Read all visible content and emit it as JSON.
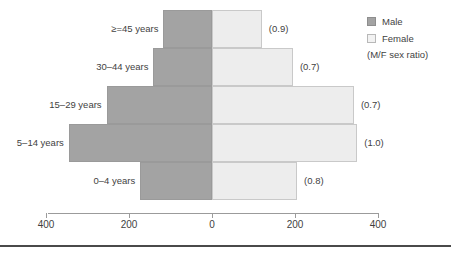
{
  "chart_data": {
    "type": "bar",
    "subtype": "population-pyramid",
    "title": "",
    "xlabel": "",
    "ylabel": "",
    "xlim": [
      -400,
      400
    ],
    "xticks": [
      -400,
      -200,
      0,
      200,
      400
    ],
    "xtick_labels": [
      "400",
      "200",
      "0",
      "200",
      "400"
    ],
    "grid": false,
    "legend_position": "top-right",
    "categories": [
      "0–4 years",
      "5–14 years",
      "15–29 years",
      "30–44 years",
      "≥=45 years"
    ],
    "series": [
      {
        "name": "Male",
        "color": "#a3a3a3",
        "values": [
          173,
          345,
          254,
          141,
          117
        ]
      },
      {
        "name": "Female",
        "color": "#ededed",
        "values": [
          205,
          350,
          342,
          195,
          120
        ]
      }
    ],
    "annotations": {
      "label": "(M/F sex ratio)",
      "values": [
        "(0.8)",
        "(1.0)",
        "(0.7)",
        "(0.7)",
        "(0.9)"
      ]
    },
    "rows": [
      {
        "age": "≥=45 years",
        "male": 117,
        "female": 120,
        "ratio": "(0.9)"
      },
      {
        "age": "30–44 years",
        "male": 141,
        "female": 195,
        "ratio": "(0.7)"
      },
      {
        "age": "15–29 years",
        "male": 254,
        "female": 342,
        "ratio": "(0.7)"
      },
      {
        "age": "5–14 years",
        "male": 345,
        "female": 350,
        "ratio": "(1.0)"
      },
      {
        "age": "0–4 years",
        "male": 173,
        "female": 205,
        "ratio": "(0.8)"
      }
    ]
  },
  "axis": {
    "ticks": [
      {
        "label": "400",
        "value": -400
      },
      {
        "label": "200",
        "value": -200
      },
      {
        "label": "0",
        "value": 0
      },
      {
        "label": "200",
        "value": 200
      },
      {
        "label": "400",
        "value": 400
      }
    ]
  },
  "legend": {
    "items": [
      {
        "label": "Male",
        "color": "#a3a3a3"
      },
      {
        "label": "Female",
        "color": "#ededed"
      }
    ],
    "note": "(M/F sex ratio)"
  }
}
